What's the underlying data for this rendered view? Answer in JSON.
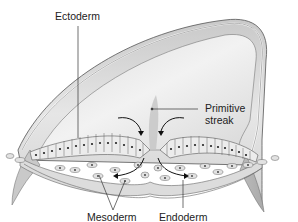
{
  "diagram": {
    "labels": {
      "ectoderm": "Ectoderm",
      "primitive_streak_line1": "Primitive",
      "primitive_streak_line2": "streak",
      "mesoderm": "Mesoderm",
      "endoderm": "Endoderm"
    },
    "colors": {
      "background": "#ffffff",
      "embryo_surface": "#d6d6d6",
      "embryo_light": "#ececec",
      "cell_fill": "#e9e9e9",
      "outline": "#555555",
      "nucleus": "#222222",
      "leader_line": "#333333"
    }
  }
}
